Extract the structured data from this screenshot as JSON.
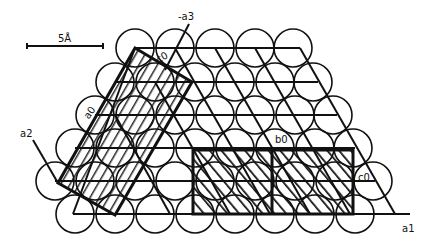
{
  "diagram": {
    "type": "crystal lattice packing",
    "scale_bar": {
      "label": "5Å"
    },
    "axes": {
      "a1": {
        "label": "a1"
      },
      "a2": {
        "label": "a2"
      },
      "neg_a3": {
        "label": "-a3"
      }
    },
    "cell_labels": {
      "c0_top": "c0",
      "a0": "a0",
      "b0": "b0",
      "c0_right": "c0"
    },
    "colors": {
      "ink": "#111111",
      "background": "#ffffff"
    }
  }
}
